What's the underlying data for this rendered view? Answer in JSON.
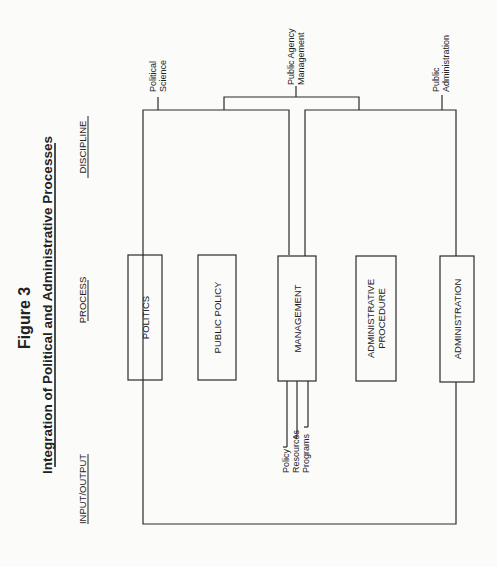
{
  "figure": {
    "number_label": "Figure 3",
    "title": "Integration of Political and Administrative Processes"
  },
  "columns": {
    "input_output": "INPUT/OUTPUT",
    "process": "PROCESS",
    "discipline": "DISCIPLINE"
  },
  "processes": [
    {
      "label_lines": [
        "POLITICS"
      ]
    },
    {
      "label_lines": [
        "PUBLIC POLICY"
      ]
    },
    {
      "label_lines": [
        "MANAGEMENT"
      ]
    },
    {
      "label_lines": [
        "ADMINISTRATIVE",
        "PROCEDURE"
      ]
    },
    {
      "label_lines": [
        "ADMINISTRATION"
      ]
    }
  ],
  "disciplines": [
    {
      "label_lines": [
        "Political",
        "Science"
      ]
    },
    {
      "label_lines": [
        "Public Agency",
        "Management"
      ]
    },
    {
      "label_lines": [
        "Public",
        "Administration"
      ]
    }
  ],
  "management_outputs": [
    "Policy",
    "Resources",
    "Programs"
  ],
  "colors": {
    "line": "#2a2a2a",
    "text": "#222222",
    "background": "#fbfbfa"
  }
}
